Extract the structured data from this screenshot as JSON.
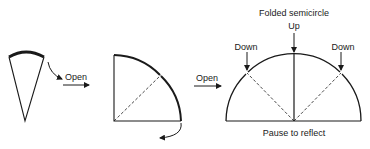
{
  "diagram": {
    "steps": [
      {
        "id": "cone",
        "description": "Folded cone (quarter of a quarter) with thick outer edge"
      },
      {
        "id": "quarter-circle",
        "description": "Opened to quarter circle with dashed fold line"
      },
      {
        "id": "semicircle",
        "description": "Opened to folded semicircle with mountain/valley folds"
      }
    ],
    "arrows": [
      {
        "label": "Open"
      },
      {
        "label": "Open"
      }
    ],
    "semicircle": {
      "title": "Folded semicircle",
      "center_label": "Up",
      "left_label": "Down",
      "right_label": "Down",
      "caption": "Pause to reflect"
    }
  },
  "colors": {
    "stroke": "#1a1a1a",
    "background": "#ffffff"
  }
}
